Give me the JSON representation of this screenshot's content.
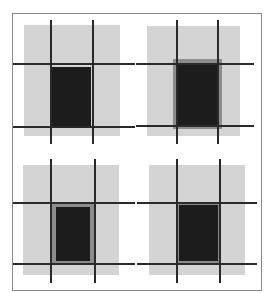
{
  "figure": {
    "colors": {
      "background": "#ffffff",
      "frame": "#8a8a8a",
      "panel_fill": "#d4d4d4",
      "guide_lines": "#2a2a2a",
      "rect_fill": "#1c1c1c",
      "rect_border": "#8c8c8c"
    },
    "panels": [
      {
        "id": "top-left",
        "variant": "rect aligned to inner grid edges"
      },
      {
        "id": "top-right",
        "variant": "rect slightly larger than grid cell with gray halo"
      },
      {
        "id": "bottom-left",
        "variant": "rect inset inside grid cell with gray border"
      },
      {
        "id": "bottom-right",
        "variant": "rect matching grid cell with thin gray border"
      }
    ]
  }
}
